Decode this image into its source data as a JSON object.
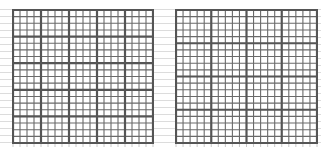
{
  "figure": {
    "colors": {
      "major_line": "#555555",
      "minor_line": "#6a6a6a",
      "background_line": "#dcdcdc",
      "background": "#ffffff"
    },
    "panels": [
      {
        "id": "left-grid",
        "x": 12,
        "y": 9,
        "width": 140,
        "height": 133,
        "major_cols": 5,
        "major_rows": 5,
        "minor_per_major": 4,
        "major_stroke": 2.2,
        "minor_stroke": 1.1
      },
      {
        "id": "right-grid",
        "x": 175,
        "y": 9,
        "width": 141,
        "height": 133,
        "major_cols": 4,
        "major_rows": 4,
        "minor_per_major": 5,
        "major_stroke": 2.2,
        "minor_stroke": 1.1
      }
    ],
    "background_rule_spacing": 7
  }
}
